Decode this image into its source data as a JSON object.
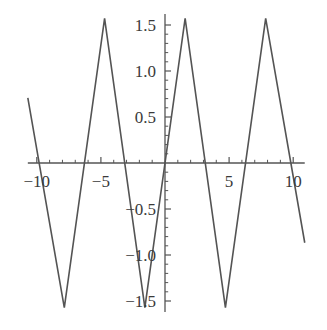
{
  "chart_data": {
    "type": "line",
    "title": "",
    "subtitle": "",
    "xlabel": "",
    "ylabel": "",
    "xlim": [
      -10.7,
      10.9
    ],
    "ylim": [
      -1.62,
      1.62
    ],
    "grid": false,
    "legend": null,
    "axes": {
      "x_axis_position_y": 0,
      "y_axis_position_x": 0,
      "x_ticks_major": [
        -10,
        -5,
        5,
        10
      ],
      "x_tick_labels": [
        "-10",
        "-5",
        "5",
        "10"
      ],
      "x_ticks_minor": [
        -9,
        -8,
        -7,
        -6,
        -4,
        -3,
        -2,
        -1,
        1,
        2,
        3,
        4,
        6,
        7,
        8,
        9
      ],
      "y_ticks_major": [
        1.5,
        1.0,
        0.5,
        -0.5,
        -1.0,
        -1.5
      ],
      "y_tick_labels": [
        "1.5",
        "1.0",
        "0.5",
        "-0.5",
        "-1.0",
        "-1.5"
      ],
      "y_ticks_minor": [
        1.4,
        1.3,
        1.2,
        1.1,
        0.9,
        0.8,
        0.7,
        0.6,
        0.4,
        0.3,
        0.2,
        0.1,
        -0.1,
        -0.2,
        -0.3,
        -0.4,
        -0.6,
        -0.7,
        -0.8,
        -0.9,
        -1.1,
        -1.2,
        -1.3,
        -1.4
      ]
    },
    "series": [
      {
        "name": "triangle-wave",
        "color": "#545454",
        "line_width": 1.6,
        "description": "Triangle wave, amplitude pi/2, period 2*pi, peaks at pi/2 + 2*pi*k",
        "points": [
          {
            "x": -10.7,
            "y": 0.707
          },
          {
            "x": -7.854,
            "y": -1.571
          },
          {
            "x": -4.712,
            "y": 1.571
          },
          {
            "x": -1.571,
            "y": -1.571
          },
          {
            "x": 1.571,
            "y": 1.571
          },
          {
            "x": 4.712,
            "y": -1.571
          },
          {
            "x": 7.854,
            "y": 1.571
          },
          {
            "x": 10.9,
            "y": -0.867
          }
        ]
      }
    ]
  },
  "style": {
    "axis_color": "#545454",
    "tick_color": "#545454",
    "label_color": "#3a3a3a",
    "background": "#ffffff"
  }
}
